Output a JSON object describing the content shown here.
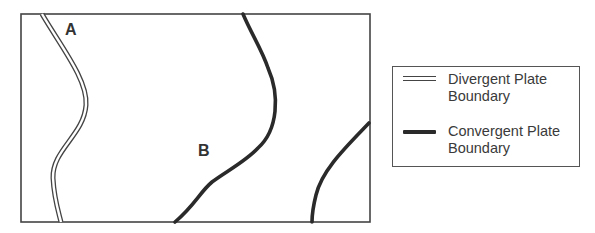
{
  "diagram": {
    "type": "plate-boundary-map",
    "labels": {
      "a": "A",
      "b": "B"
    },
    "boundaries": [
      {
        "id": "divergent-boundary-a",
        "kind": "divergent",
        "style": "double-line",
        "near_label": "A"
      },
      {
        "id": "convergent-boundary-b",
        "kind": "convergent",
        "style": "thick-line",
        "near_label": "B"
      },
      {
        "id": "convergent-boundary-east",
        "kind": "convergent",
        "style": "thick-line"
      }
    ],
    "colors": {
      "frame": "#444444",
      "line": "#2a2a2a",
      "text": "#333333",
      "background": "#ffffff"
    }
  },
  "legend": {
    "items": [
      {
        "symbol": "double-line-icon",
        "line1": "Divergent Plate",
        "line2": "Boundary"
      },
      {
        "symbol": "thick-line-icon",
        "line1": "Convergent Plate",
        "line2": "Boundary"
      }
    ]
  }
}
